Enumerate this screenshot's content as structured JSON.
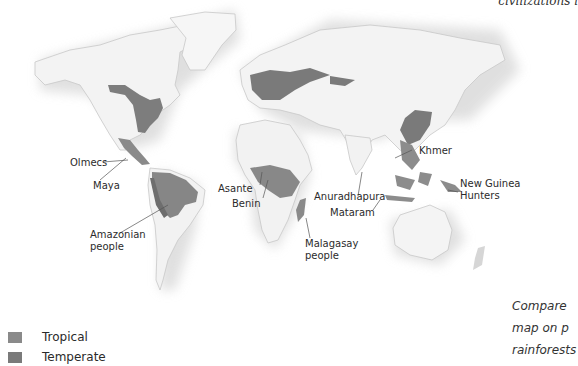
{
  "header": {
    "caption_fragment": "civilizations i"
  },
  "map": {
    "labels": [
      {
        "text": "Olmecs"
      },
      {
        "text": "Maya"
      },
      {
        "text": "Amazonian",
        "line2": "people"
      },
      {
        "text": "Asante"
      },
      {
        "text": "Benin"
      },
      {
        "text": "Anuradhapura"
      },
      {
        "text": "Mataram"
      },
      {
        "text": "Malagasay",
        "line2": "people"
      },
      {
        "text": "Khmer"
      },
      {
        "text": "New Guinea",
        "line2": "Hunters"
      }
    ],
    "colors": {
      "land": "#f2f2f2",
      "relief": "#d9d9d9",
      "temperate": "#7c7c7c",
      "tropical": "#8e8e8e",
      "ocean_glow": "#e6e6e6"
    }
  },
  "legend": {
    "items": [
      {
        "label": "Tropical",
        "color": "#8a8a8a"
      },
      {
        "label": "Temperate",
        "color": "#7a7a7a"
      }
    ]
  },
  "side_note": {
    "lines": [
      "Compare",
      "map on p",
      "rainforests"
    ]
  }
}
